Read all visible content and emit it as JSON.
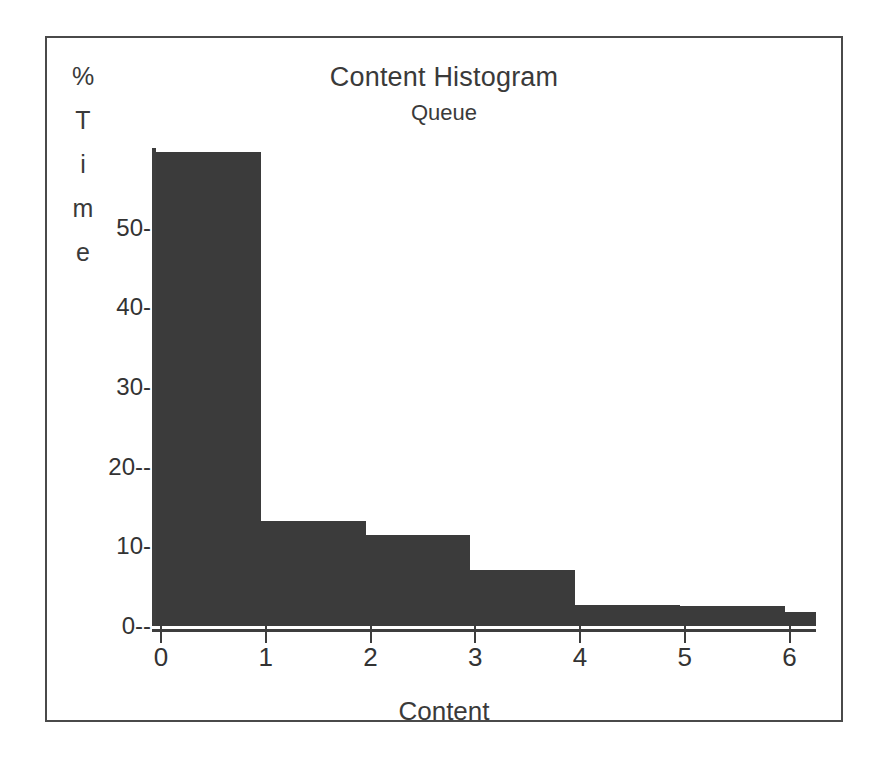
{
  "chart_data": {
    "type": "bar",
    "title": "Content Histogram",
    "subtitle": "Queue",
    "xlabel": "Content",
    "ylabel": "% Time",
    "ylabel_chars": [
      "%",
      "T",
      "i",
      "m",
      "e"
    ],
    "grid": false,
    "legend": "none",
    "xlim": [
      0,
      6.3
    ],
    "ylim": [
      0,
      60
    ],
    "xtick_labels": [
      "0",
      "1",
      "2",
      "3",
      "4",
      "5",
      "6"
    ],
    "xticks": [
      0,
      1,
      2,
      3,
      4,
      5,
      6
    ],
    "ytick_labels": [
      "50-",
      "40-",
      "30-",
      "20--",
      "10-",
      "0--"
    ],
    "yticks": [
      50,
      40,
      30,
      20,
      10,
      0
    ],
    "bin_edges": [
      0,
      1,
      2,
      3,
      4,
      5,
      6,
      6.3
    ],
    "categories": [
      "0-1",
      "1-2",
      "2-3",
      "3-4",
      "4-5",
      "5-6",
      "6+"
    ],
    "values": [
      59.5,
      13.2,
      11.4,
      7.0,
      2.6,
      2.5,
      1.8
    ],
    "bar_color": "#3b3b3b",
    "axis_color": "#3d3d3d",
    "frame_color": "#4a4a4a",
    "background": "#ffffff"
  }
}
